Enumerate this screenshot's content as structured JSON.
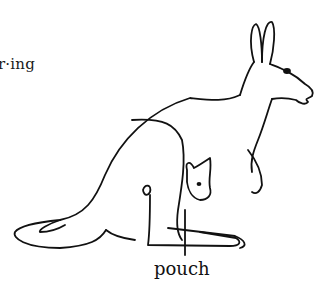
{
  "page": {
    "headword_fragment": "r·ing",
    "illustration": {
      "subject": "kangaroo with joey in pouch",
      "labels": [
        {
          "text": "pouch"
        }
      ]
    }
  }
}
